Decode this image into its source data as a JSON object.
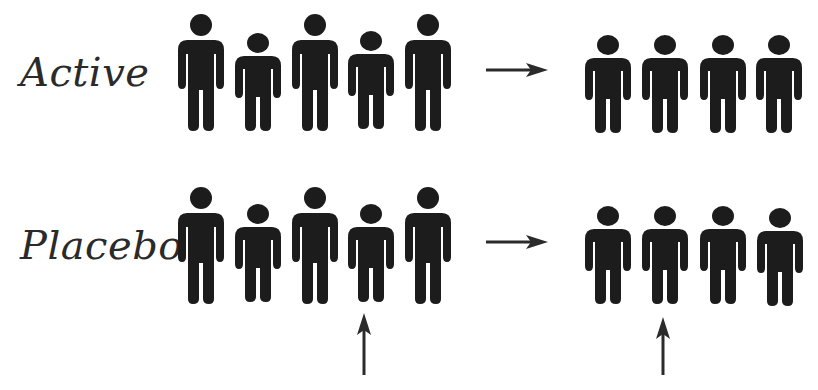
{
  "colors": {
    "figure": "#1c1c1c",
    "arrow": "#2b2b2b",
    "text": "#2a2a2a",
    "background": "#ffffff"
  },
  "rows": [
    {
      "label": "Active",
      "label_pos": {
        "x": 20,
        "y": 52
      },
      "before_group": [
        {
          "size": "tall",
          "x": 178,
          "y": 14
        },
        {
          "size": "short",
          "x": 235,
          "y": 33
        },
        {
          "size": "tall",
          "x": 292,
          "y": 14
        },
        {
          "size": "short",
          "x": 348,
          "y": 31
        },
        {
          "size": "tall",
          "x": 405,
          "y": 14
        }
      ],
      "arrow": {
        "icon": "right-arrow-icon",
        "x": 486,
        "y": 62
      },
      "after_group": [
        {
          "size": "short",
          "x": 585,
          "y": 35
        },
        {
          "size": "short",
          "x": 642,
          "y": 35
        },
        {
          "size": "short",
          "x": 700,
          "y": 35
        },
        {
          "size": "short",
          "x": 756,
          "y": 35
        }
      ],
      "highlight_arrows": []
    },
    {
      "label": "Placebo",
      "label_pos": {
        "x": 20,
        "y": 225
      },
      "before_group": [
        {
          "size": "tall",
          "x": 178,
          "y": 187
        },
        {
          "size": "short",
          "x": 235,
          "y": 204
        },
        {
          "size": "tall",
          "x": 292,
          "y": 187
        },
        {
          "size": "short",
          "x": 348,
          "y": 204
        },
        {
          "size": "tall",
          "x": 405,
          "y": 187
        }
      ],
      "arrow": {
        "icon": "right-arrow-icon",
        "x": 486,
        "y": 234
      },
      "after_group": [
        {
          "size": "short",
          "x": 585,
          "y": 206
        },
        {
          "size": "short",
          "x": 642,
          "y": 206
        },
        {
          "size": "short",
          "x": 700,
          "y": 206
        },
        {
          "size": "short",
          "x": 757,
          "y": 208
        }
      ],
      "highlight_arrows": [
        {
          "icon": "up-arrow-icon",
          "x": 356,
          "y": 313,
          "height": 62
        },
        {
          "icon": "up-arrow-icon",
          "x": 655,
          "y": 317,
          "height": 58
        }
      ]
    }
  ]
}
